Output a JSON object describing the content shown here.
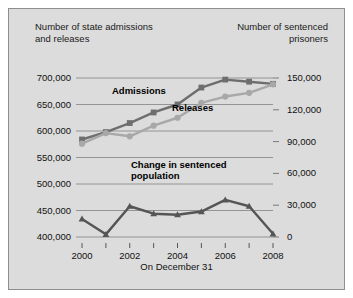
{
  "figure": {
    "background_color": "#dcdcdc",
    "border_color": "#8e8e8e",
    "left_axis_title": "Number of state admissions\nand releases",
    "right_axis_title": "Number of sentenced\nprisoners",
    "x_title": "On December 31"
  },
  "chart_data": {
    "type": "line",
    "title": "",
    "subtitle": "",
    "xlabel": "On December 31",
    "ylabel": "Number of state admissions and releases",
    "y2label": "Number of sentenced prisoners",
    "x": [
      2000,
      2001,
      2002,
      2003,
      2004,
      2005,
      2006,
      2007,
      2008
    ],
    "tick_labels_x": [
      "2000",
      "",
      "2002",
      "",
      "2004",
      "",
      "2006",
      "",
      "2008"
    ],
    "all_x_ticks": [
      "2000",
      "2001",
      "2002",
      "2003",
      "2004",
      "2005",
      "2006",
      "2007",
      "2008"
    ],
    "ylim": [
      400000,
      700000
    ],
    "yticks": [
      400000,
      450000,
      500000,
      550000,
      600000,
      650000,
      700000
    ],
    "ytick_labels": [
      "400,000",
      "450,000",
      "500,000",
      "550,000",
      "600,000",
      "650,000",
      "700,000"
    ],
    "y2lim": [
      0,
      150000
    ],
    "y2ticks": [
      0,
      30000,
      60000,
      90000,
      120000,
      150000
    ],
    "y2tick_labels": [
      "0",
      "30,000",
      "60,000",
      "90,000",
      "120,000",
      "150,000"
    ],
    "grid": true,
    "legend": "inline-labels",
    "series": [
      {
        "name": "Admissions",
        "axis": "left",
        "color": "#6e6e6e",
        "marker": "square",
        "values": [
          584000,
          598000,
          615000,
          635000,
          650000,
          682000,
          697000,
          693000,
          689000
        ]
      },
      {
        "name": "Releases",
        "axis": "left",
        "color": "#a8a8a8",
        "marker": "circle",
        "values": [
          576000,
          596000,
          590000,
          610000,
          625000,
          653000,
          665000,
          672000,
          688000
        ]
      },
      {
        "name": "Change in sentenced\npopulation",
        "axis": "right",
        "color": "#555555",
        "marker": "triangle",
        "values": [
          17000,
          2500,
          29000,
          22000,
          21000,
          24000,
          35000,
          29000,
          3000
        ]
      }
    ],
    "annotations": [
      {
        "text": "Admissions",
        "series": "Admissions"
      },
      {
        "text": "Releases",
        "series": "Releases"
      },
      {
        "text": "Change in sentenced\npopulation",
        "series": "Change in sentenced population"
      }
    ]
  }
}
